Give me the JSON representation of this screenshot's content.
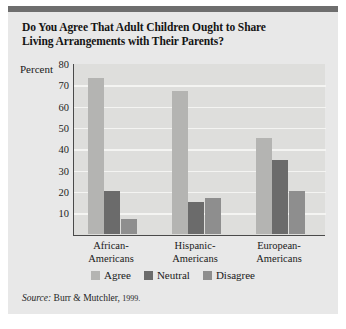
{
  "figure": {
    "title_line1": "Do You Agree That Adult Children Ought to Share",
    "title_line2": "Living Arrangements with Their Parents?",
    "axis_label": "Percent",
    "source_prefix": "Source:",
    "source_text": "Burr & Mutchler,",
    "source_year": "1999."
  },
  "colors": {
    "agree": "#b4b4b2",
    "neutral": "#6b6b6b",
    "disagree": "#8e8e8e",
    "plot_background": "#dededc",
    "card_background": "#e8e8e8",
    "grid": "#f4f4f2",
    "axis": "#4a4a4a",
    "top_rule": "#6e6e6e"
  },
  "chart_data": {
    "type": "bar",
    "title": "Do You Agree That Adult Children Ought to Share Living Arrangements with Their Parents?",
    "xlabel": "",
    "ylabel": "Percent",
    "ylim": [
      0,
      80
    ],
    "yticks": [
      10,
      20,
      30,
      40,
      50,
      60,
      70,
      80
    ],
    "grid": true,
    "legend_position": "bottom",
    "categories": [
      "African-Americans",
      "Hispanic-Americans",
      "European-Americans"
    ],
    "category_lines": [
      [
        "African-",
        "Americans"
      ],
      [
        "Hispanic-",
        "Americans"
      ],
      [
        "European-",
        "Americans"
      ]
    ],
    "series": [
      {
        "name": "Agree",
        "values": [
          73,
          67,
          45
        ]
      },
      {
        "name": "Neutral",
        "values": [
          20,
          15,
          34.5
        ]
      },
      {
        "name": "Disagree",
        "values": [
          7,
          16.5,
          20
        ]
      }
    ]
  }
}
